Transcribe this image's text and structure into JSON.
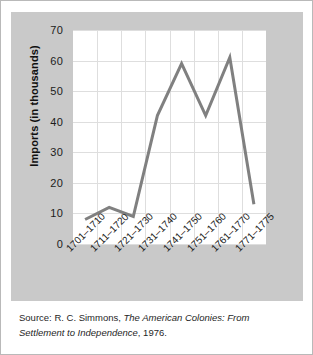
{
  "figure": {
    "panel_background": "#c9c9c9",
    "plot_background": "#ffffff",
    "line_color": "#808080",
    "grid_color": "#dedede"
  },
  "chart_data": {
    "type": "line",
    "title": "",
    "xlabel": "",
    "ylabel": "Imports (in thousands)",
    "categories": [
      "1701–1710",
      "1711–1720",
      "1721–1730",
      "1731–1740",
      "1741–1750",
      "1751–1760",
      "1761–1770",
      "1771–1775"
    ],
    "values": [
      8,
      12,
      9,
      42,
      59,
      42,
      61,
      13
    ],
    "ylim": [
      0,
      70
    ],
    "yticks": [
      0,
      10,
      20,
      30,
      40,
      50,
      60,
      70
    ],
    "ytick_labels": [
      "0",
      "10",
      "20",
      "30",
      "40",
      "50",
      "60",
      "70"
    ],
    "grid": "horizontal-and-vertical",
    "legend": "none",
    "series": [
      {
        "name": "Imports",
        "values": [
          8,
          12,
          9,
          42,
          59,
          42,
          61,
          13
        ]
      }
    ]
  },
  "source": {
    "prefix": "Source: R. C. Simmons, ",
    "work_title": "The American Colonies: From Settlement to Independence",
    "suffix": ", 1976."
  }
}
